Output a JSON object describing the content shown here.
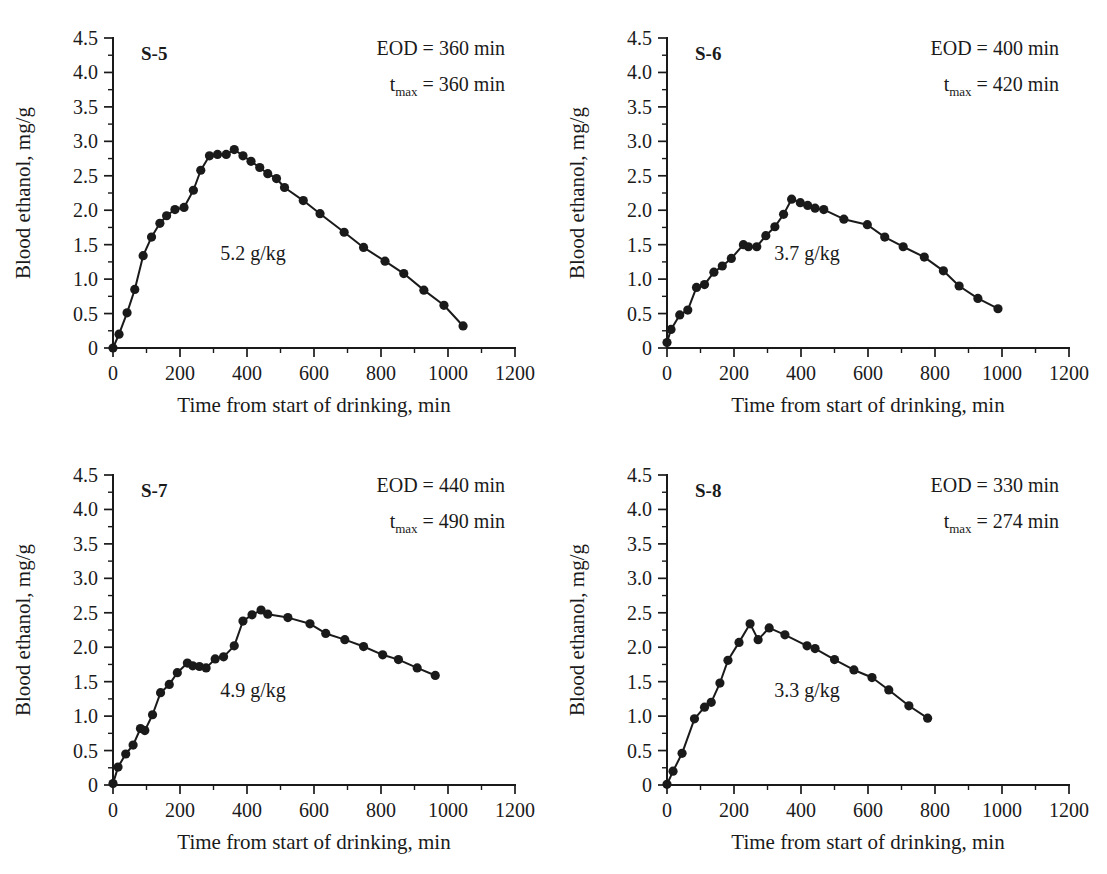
{
  "figure": {
    "background_color": "#ffffff",
    "ink_color": "#1a1a1a",
    "panel_count": 4
  },
  "axis_common": {
    "xlabel": "Time from start of drinking, min",
    "ylabel": "Blood ethanol, mg/g",
    "xticks": [
      0,
      200,
      400,
      600,
      800,
      1000,
      1200
    ],
    "xtick_labels": [
      "0",
      "200",
      "400",
      "600",
      "800",
      "1000",
      "1200"
    ],
    "yticks": [
      0,
      0.5,
      1.0,
      1.5,
      2.0,
      2.5,
      3.0,
      3.5,
      4.0,
      4.5
    ],
    "ytick_labels": [
      "0",
      "0.5",
      "1.0",
      "1.5",
      "2.0",
      "2.5",
      "3.0",
      "3.5",
      "4.0",
      "4.5"
    ],
    "xlim": [
      0,
      1200
    ],
    "ylim": [
      0,
      4.5
    ],
    "x_minor_step": 100,
    "y_minor_step": 0.25,
    "grid": false,
    "legend": "none"
  },
  "chart_data": [
    {
      "type": "line",
      "panel": "top-left",
      "title": "S-5",
      "subject": "S-5",
      "dose_label": "5.2 g/kg",
      "eod_label": "EOD = 360 min",
      "tmax_prefix": "t",
      "tmax_subscript": "max",
      "tmax_label": " = 360 min",
      "eod_min": 360,
      "tmax_min": 360,
      "dose_g_per_kg": 5.2,
      "xlabel": "Time from start of drinking, min",
      "ylabel": "Blood ethanol, mg/g",
      "xlim": [
        0,
        1200
      ],
      "ylim": [
        0,
        4.5
      ],
      "x": [
        0,
        18,
        42,
        65,
        90,
        115,
        140,
        160,
        185,
        212,
        240,
        262,
        288,
        312,
        338,
        362,
        388,
        412,
        438,
        462,
        488,
        512,
        568,
        618,
        690,
        748,
        812,
        868,
        928,
        988,
        1045
      ],
      "y": [
        0.0,
        0.2,
        0.51,
        0.85,
        1.34,
        1.61,
        1.81,
        1.92,
        2.01,
        2.04,
        2.29,
        2.58,
        2.79,
        2.81,
        2.81,
        2.88,
        2.79,
        2.71,
        2.62,
        2.53,
        2.46,
        2.33,
        2.14,
        1.95,
        1.68,
        1.46,
        1.26,
        1.08,
        0.84,
        0.62,
        0.32
      ]
    },
    {
      "type": "line",
      "panel": "top-right",
      "title": "S-6",
      "subject": "S-6",
      "dose_label": "3.7 g/kg",
      "eod_label": "EOD = 400 min",
      "tmax_prefix": "t",
      "tmax_subscript": "max",
      "tmax_label": " = 420 min",
      "eod_min": 400,
      "tmax_min": 420,
      "dose_g_per_kg": 3.7,
      "xlabel": "Time from start of drinking, min",
      "ylabel": "Blood ethanol, mg/g",
      "xlim": [
        0,
        1200
      ],
      "ylim": [
        0,
        4.5
      ],
      "x": [
        0,
        12,
        38,
        62,
        88,
        112,
        140,
        165,
        192,
        228,
        243,
        268,
        295,
        322,
        348,
        372,
        398,
        420,
        442,
        468,
        528,
        598,
        650,
        705,
        768,
        825,
        872,
        928,
        988
      ],
      "y": [
        0.08,
        0.27,
        0.48,
        0.55,
        0.88,
        0.92,
        1.1,
        1.19,
        1.3,
        1.5,
        1.47,
        1.47,
        1.63,
        1.76,
        1.94,
        2.16,
        2.11,
        2.07,
        2.03,
        2.01,
        1.87,
        1.79,
        1.61,
        1.47,
        1.32,
        1.12,
        0.9,
        0.72,
        0.57
      ]
    },
    {
      "type": "line",
      "panel": "bottom-left",
      "title": "S-7",
      "subject": "S-7",
      "dose_label": "4.9 g/kg",
      "eod_label": "EOD = 440 min",
      "tmax_prefix": "t",
      "tmax_subscript": "max",
      "tmax_label": " = 490 min",
      "eod_min": 440,
      "tmax_min": 490,
      "dose_g_per_kg": 4.9,
      "xlabel": "Time from start of drinking, min",
      "ylabel": "Blood ethanol, mg/g",
      "xlim": [
        0,
        1200
      ],
      "ylim": [
        0,
        4.5
      ],
      "x": [
        0,
        15,
        38,
        60,
        82,
        95,
        118,
        142,
        168,
        192,
        222,
        238,
        258,
        278,
        305,
        330,
        362,
        388,
        415,
        442,
        462,
        522,
        588,
        635,
        692,
        748,
        805,
        852,
        908,
        962
      ],
      "y": [
        0.02,
        0.26,
        0.45,
        0.58,
        0.82,
        0.79,
        1.02,
        1.34,
        1.46,
        1.63,
        1.77,
        1.73,
        1.72,
        1.7,
        1.83,
        1.86,
        2.02,
        2.38,
        2.47,
        2.54,
        2.48,
        2.43,
        2.34,
        2.2,
        2.11,
        2.01,
        1.89,
        1.82,
        1.7,
        1.59
      ]
    },
    {
      "type": "line",
      "panel": "bottom-right",
      "title": "S-8",
      "subject": "S-8",
      "dose_label": "3.3 g/kg",
      "eod_label": "EOD = 330 min",
      "tmax_prefix": "t",
      "tmax_subscript": "max",
      "tmax_label": " = 274 min",
      "eod_min": 330,
      "tmax_min": 274,
      "dose_g_per_kg": 3.3,
      "xlabel": "Time from start of drinking, min",
      "ylabel": "Blood ethanol, mg/g",
      "xlim": [
        0,
        1200
      ],
      "ylim": [
        0,
        4.5
      ],
      "x": [
        0,
        18,
        45,
        82,
        112,
        132,
        158,
        182,
        215,
        248,
        272,
        305,
        352,
        418,
        442,
        500,
        558,
        612,
        662,
        722,
        778
      ],
      "y": [
        0.01,
        0.2,
        0.46,
        0.96,
        1.13,
        1.2,
        1.48,
        1.81,
        2.07,
        2.34,
        2.11,
        2.28,
        2.18,
        2.02,
        1.98,
        1.82,
        1.67,
        1.56,
        1.38,
        1.15,
        0.97
      ]
    }
  ]
}
